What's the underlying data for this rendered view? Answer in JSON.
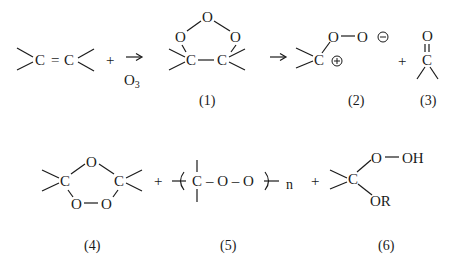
{
  "diagram": {
    "type": "chemical-reaction-scheme",
    "colors": {
      "ink": "#1a1a1a",
      "background": "#ffffff"
    },
    "row1": {
      "reactant": {
        "atom_left": "C",
        "bond": "=",
        "atom_right": "C"
      },
      "plus1": "+",
      "arrow1": "→",
      "reagent": {
        "symbol": "O",
        "subscript": "3"
      },
      "compound1": {
        "o_top": "O",
        "o_left": "O",
        "o_right": "O",
        "c_left": "C",
        "c_right": "C",
        "label": "(1)"
      },
      "arrow2": "→",
      "compound2": {
        "carbon": "C",
        "o1": "O",
        "o2": "O",
        "bond": "—",
        "negative_charge": "⊖",
        "positive_charge": "⊕",
        "label": "(2)"
      },
      "plus2": "+",
      "compound3": {
        "oxygen": "O",
        "carbon": "C",
        "label": "(3)"
      }
    },
    "row2": {
      "compound4": {
        "c_left": "C",
        "o_top": "O",
        "c_right": "C",
        "o_bottom_left": "O",
        "o_bottom_right": "O",
        "label": "(4)"
      },
      "plus3": "+",
      "compound5": {
        "carbon": "C",
        "chain": "– O – O",
        "repeat": "n",
        "label": "(5)"
      },
      "plus4": "+",
      "compound6": {
        "carbon": "C",
        "o_peroxy": "O",
        "hydroxyl": "OH",
        "alkoxy": "OR",
        "label": "(6)"
      }
    }
  }
}
